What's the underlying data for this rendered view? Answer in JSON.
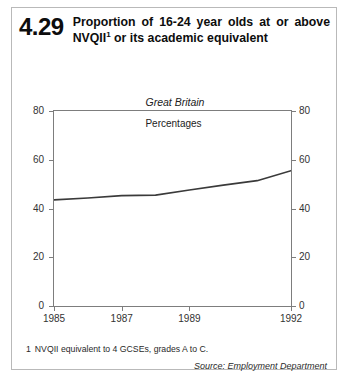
{
  "figure": {
    "number": "4.29",
    "title_line1": "Proportion of 16-24 year olds at or",
    "title_line2_pre": "above NVQII",
    "title_superscript": "1",
    "title_line2_post": " or its academic",
    "title_line3": "equivalent",
    "title_full": "Proportion of 16-24 year olds at or above NVQII¹ or its academic equivalent",
    "region": "Great Britain",
    "units": "Percentages",
    "footnote_marker": "1",
    "footnote_text": "NVQII equivalent to 4 GCSEs, grades A to C.",
    "source": "Source: Employment Department"
  },
  "chart_data": {
    "type": "line",
    "subtitle": "Great Britain",
    "xlabel": "",
    "ylabel": "Percentages",
    "ylim": [
      0,
      80
    ],
    "xlim": [
      1985,
      1992
    ],
    "yticks": [
      0,
      20,
      40,
      60,
      80
    ],
    "ytick_labels": [
      "0",
      "20",
      "40",
      "60",
      "80"
    ],
    "xticks": [
      1985,
      1987,
      1989,
      1992
    ],
    "xtick_labels": [
      "1985",
      "1987",
      "1989",
      "1992"
    ],
    "grid": false,
    "legend": false,
    "right_axis": true,
    "right_ytick_labels": [
      "0",
      "20",
      "40",
      "60",
      "80"
    ],
    "line_color": "#3a3a3a",
    "x": [
      1985,
      1986,
      1987,
      1988,
      1989,
      1990,
      1991,
      1992
    ],
    "values": [
      43.5,
      44.3,
      45.3,
      45.5,
      47.6,
      49.6,
      51.4,
      55.5
    ],
    "series": [
      {
        "name": "Proportion at or above NVQII",
        "values": [
          43.5,
          44.3,
          45.3,
          45.5,
          47.6,
          49.6,
          51.4,
          55.5
        ]
      }
    ]
  }
}
